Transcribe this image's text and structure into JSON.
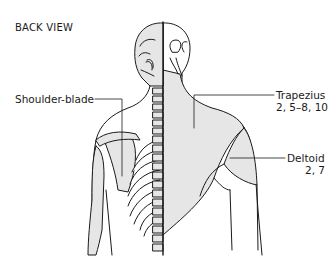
{
  "diagram": {
    "title": "BACK VIEW",
    "labels": [
      {
        "name": "Shoulder-blade",
        "numbers": ""
      },
      {
        "name": "Trapezius",
        "numbers": "2, 5–8, 10"
      },
      {
        "name": "Deltoid",
        "numbers": "2, 7"
      }
    ]
  },
  "colors": {
    "fill": "#e6e6e6",
    "line": "#1a1a1a",
    "background": "#ffffff"
  }
}
